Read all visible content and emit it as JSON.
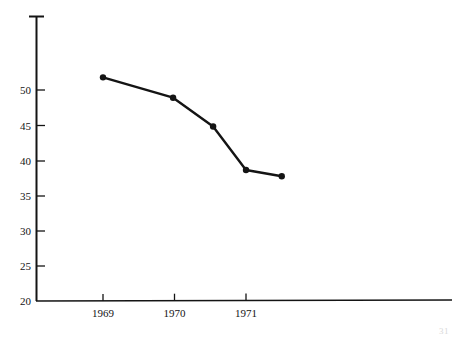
{
  "chart_data": {
    "type": "line",
    "title": "",
    "subtitle": "",
    "xlabel": "",
    "ylabel": "",
    "x": [
      1969.0,
      1969.98,
      1970.54,
      1971.0,
      1971.5
    ],
    "values": [
      51.8,
      48.9,
      44.8,
      38.6,
      37.7
    ],
    "series": [
      {
        "name": "",
        "x": [
          1969.0,
          1969.98,
          1970.54,
          1971.0,
          1971.5
        ],
        "values": [
          51.8,
          48.9,
          44.8,
          38.6,
          37.7
        ]
      }
    ],
    "xtick_labels": [
      "1969",
      "1970",
      "1971"
    ],
    "xtick_values": [
      1969,
      1970,
      1971
    ],
    "ytick_labels": [
      "50",
      "45",
      "40",
      "35",
      "30",
      "25",
      "20"
    ],
    "ytick_values": [
      50,
      45,
      40,
      35,
      30,
      25,
      20
    ],
    "ylim": [
      20,
      53.5
    ],
    "xlim": [
      1968.37,
      1974.6
    ],
    "grid": false,
    "legend": null,
    "legend_position": "none",
    "marker": "filled-circle",
    "line_color": "#141414",
    "axis_color": "#141414",
    "background_color": "#ffffff",
    "annotations": []
  },
  "footer": {
    "page_number": "31"
  }
}
